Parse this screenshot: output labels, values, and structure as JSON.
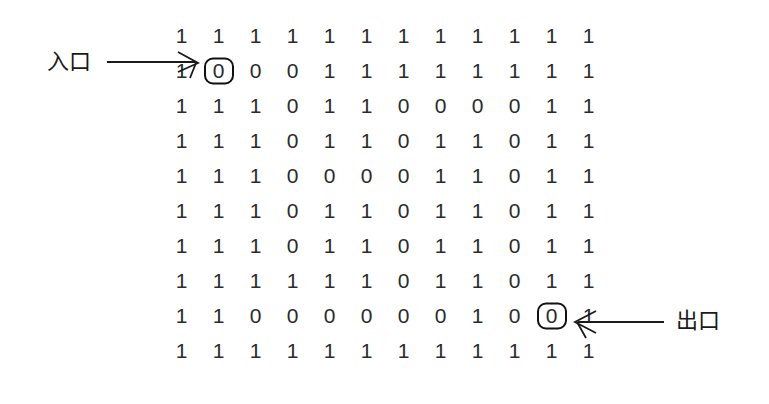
{
  "diagram": {
    "title_visible": false,
    "entrance_label": "入口",
    "exit_label": "出口",
    "ink_color": "#2b2b2b",
    "mark_color": "#111111",
    "background": "#ffffff"
  },
  "chart_data": {
    "type": "heatmap",
    "title": "",
    "xlabel": "",
    "ylabel": "",
    "rows": 10,
    "cols": 12,
    "values": [
      [
        1,
        1,
        1,
        1,
        1,
        1,
        1,
        1,
        1,
        1,
        1,
        1
      ],
      [
        1,
        0,
        0,
        0,
        1,
        1,
        1,
        1,
        1,
        1,
        1,
        1
      ],
      [
        1,
        1,
        1,
        0,
        1,
        1,
        0,
        0,
        0,
        0,
        1,
        1
      ],
      [
        1,
        1,
        1,
        0,
        1,
        1,
        0,
        1,
        1,
        0,
        1,
        1
      ],
      [
        1,
        1,
        1,
        0,
        0,
        0,
        0,
        1,
        1,
        0,
        1,
        1
      ],
      [
        1,
        1,
        1,
        0,
        1,
        1,
        0,
        1,
        1,
        0,
        1,
        1
      ],
      [
        1,
        1,
        1,
        0,
        1,
        1,
        0,
        1,
        1,
        0,
        1,
        1
      ],
      [
        1,
        1,
        1,
        1,
        1,
        1,
        0,
        1,
        1,
        0,
        1,
        1
      ],
      [
        1,
        1,
        0,
        0,
        0,
        0,
        0,
        0,
        1,
        0,
        0,
        1
      ],
      [
        1,
        1,
        1,
        1,
        1,
        1,
        1,
        1,
        1,
        1,
        1,
        1
      ]
    ],
    "marked_cells": [
      {
        "row": 1,
        "col": 1,
        "role": "entrance"
      },
      {
        "row": 8,
        "col": 10,
        "role": "exit"
      }
    ],
    "legend": []
  },
  "annotations": [
    {
      "name": "entrance",
      "text": "入口",
      "arrow": "right"
    },
    {
      "name": "exit",
      "text": "出口",
      "arrow": "left"
    }
  ]
}
